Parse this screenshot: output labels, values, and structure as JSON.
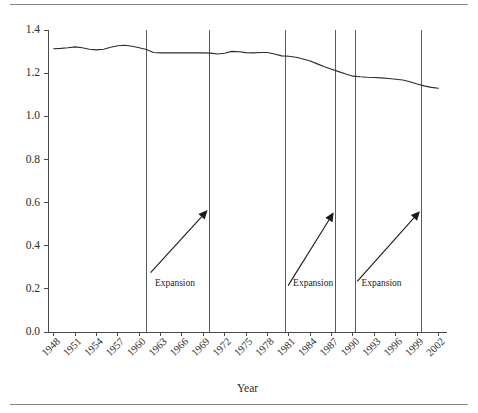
{
  "chart_data": {
    "type": "line",
    "title": "",
    "xlabel": "Year",
    "ylabel": "",
    "xlim": [
      1947.2,
      2003.2
    ],
    "ylim": [
      0.0,
      1.4
    ],
    "grid": false,
    "legend": "none",
    "y_ticks": [
      "0.0",
      "0.2",
      "0.4",
      "0.6",
      "0.8",
      "1.0",
      "1.2",
      "1.4"
    ],
    "y_tick_values": [
      0.0,
      0.2,
      0.4,
      0.6,
      0.8,
      1.0,
      1.2,
      1.4
    ],
    "x_ticks": [
      "1948",
      "1951",
      "1954",
      "1957",
      "1960",
      "1963",
      "1966",
      "1969",
      "1972",
      "1975",
      "1978",
      "1981",
      "1984",
      "1987",
      "1990",
      "1993",
      "1996",
      "1999",
      "2002"
    ],
    "x_tick_values": [
      1948,
      1951,
      1954,
      1957,
      1960,
      1963,
      1966,
      1969,
      1972,
      1975,
      1978,
      1981,
      1984,
      1987,
      1990,
      1993,
      1996,
      1999,
      2002
    ],
    "x": [
      1948,
      1949,
      1950,
      1951,
      1952,
      1953,
      1954,
      1955,
      1956,
      1957,
      1958,
      1959,
      1960,
      1961,
      1962,
      1963,
      1964,
      1965,
      1966,
      1967,
      1968,
      1969,
      1970,
      1971,
      1972,
      1973,
      1974,
      1975,
      1976,
      1977,
      1978,
      1979,
      1980,
      1981,
      1982,
      1983,
      1984,
      1985,
      1986,
      1987,
      1988,
      1989,
      1990,
      1991,
      1992,
      1993,
      1994,
      1995,
      1996,
      1997,
      1998,
      1999,
      2000,
      2001,
      2002
    ],
    "y": [
      1.313,
      1.315,
      1.318,
      1.322,
      1.318,
      1.311,
      1.308,
      1.311,
      1.32,
      1.327,
      1.329,
      1.325,
      1.318,
      1.31,
      1.296,
      1.294,
      1.294,
      1.294,
      1.294,
      1.294,
      1.294,
      1.294,
      1.293,
      1.289,
      1.292,
      1.301,
      1.299,
      1.295,
      1.294,
      1.296,
      1.296,
      1.289,
      1.28,
      1.278,
      1.274,
      1.266,
      1.256,
      1.243,
      1.23,
      1.218,
      1.207,
      1.196,
      1.186,
      1.183,
      1.181,
      1.18,
      1.178,
      1.175,
      1.172,
      1.168,
      1.16,
      1.15,
      1.141,
      1.134,
      1.13
    ],
    "series": [
      {
        "name": "ratio",
        "values": [
          1.313,
          1.315,
          1.318,
          1.322,
          1.318,
          1.311,
          1.308,
          1.311,
          1.32,
          1.327,
          1.329,
          1.325,
          1.318,
          1.31,
          1.296,
          1.294,
          1.294,
          1.294,
          1.294,
          1.294,
          1.294,
          1.294,
          1.293,
          1.289,
          1.292,
          1.301,
          1.299,
          1.295,
          1.294,
          1.296,
          1.296,
          1.289,
          1.28,
          1.278,
          1.274,
          1.266,
          1.256,
          1.243,
          1.23,
          1.218,
          1.207,
          1.196,
          1.186,
          1.183,
          1.181,
          1.18,
          1.178,
          1.175,
          1.172,
          1.168,
          1.16,
          1.15,
          1.141,
          1.134,
          1.13
        ]
      }
    ],
    "vertical_lines": [
      1961.0,
      1969.8,
      1980.6,
      1987.5,
      1990.3,
      1999.6
    ],
    "annotations": [
      {
        "label": "Expansion",
        "text_x": 1962.2,
        "text_y": 0.215,
        "arrow_from": [
          1961.6,
          0.275
        ],
        "arrow_to": [
          1969.6,
          0.565
        ]
      },
      {
        "label": "Expansion",
        "text_x": 1981.6,
        "text_y": 0.215,
        "arrow_from": [
          1980.9,
          0.215
        ],
        "arrow_to": [
          1987.3,
          0.555
        ]
      },
      {
        "label": "Expansion",
        "text_x": 1991.2,
        "text_y": 0.215,
        "arrow_from": [
          1990.6,
          0.235
        ],
        "arrow_to": [
          1999.4,
          0.56
        ]
      }
    ]
  },
  "figure": {
    "x_axis_title": "Year"
  }
}
